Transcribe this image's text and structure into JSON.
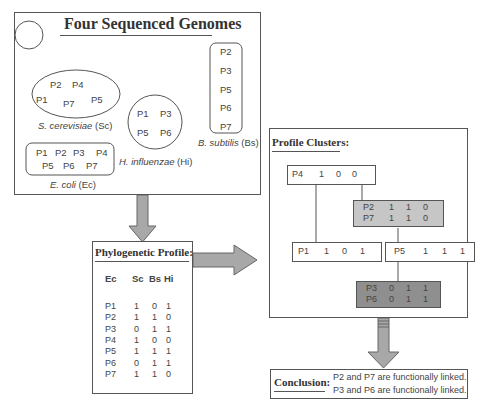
{
  "genomes_panel": {
    "title": "Four Sequenced Genomes",
    "organisms": [
      {
        "name_italic": "S. cerevisiae",
        "abbr": "(Sc)",
        "proteins": [
          "P2",
          "P4",
          "P1",
          "P7",
          "P5"
        ]
      },
      {
        "name_italic": "E. coli",
        "abbr": "(Ec)",
        "proteins": [
          "P1",
          "P2",
          "P3",
          "P4",
          "P5",
          "P6",
          "P7"
        ]
      },
      {
        "name_italic": "H. influenzae",
        "abbr": "(Hi)",
        "proteins": [
          "P1",
          "P3",
          "P5",
          "P6"
        ]
      },
      {
        "name_italic": "B. subtilis",
        "abbr": "(Bs)",
        "proteins": [
          "P2",
          "P3",
          "P5",
          "P6",
          "P7"
        ]
      }
    ]
  },
  "profile_panel": {
    "title": "Phylogenetic Profile:",
    "headers": [
      "Ec",
      "Sc",
      "Bs",
      "Hi"
    ],
    "rows": [
      {
        "protein": "P1",
        "sc": "1",
        "bs": "0",
        "hi": "1"
      },
      {
        "protein": "P2",
        "sc": "1",
        "bs": "1",
        "hi": "0"
      },
      {
        "protein": "P3",
        "sc": "0",
        "bs": "1",
        "hi": "1"
      },
      {
        "protein": "P4",
        "sc": "1",
        "bs": "0",
        "hi": "0"
      },
      {
        "protein": "P5",
        "sc": "1",
        "bs": "1",
        "hi": "1"
      },
      {
        "protein": "P6",
        "sc": "0",
        "bs": "1",
        "hi": "1"
      },
      {
        "protein": "P7",
        "sc": "1",
        "bs": "1",
        "hi": "0"
      }
    ]
  },
  "clusters_panel": {
    "title": "Profile Clusters:",
    "nodes": [
      {
        "id": "p4",
        "rows": [
          [
            "P4",
            "1",
            "0",
            "0"
          ]
        ],
        "shade": "none"
      },
      {
        "id": "p2p7",
        "rows": [
          [
            "P2",
            "1",
            "1",
            "0"
          ],
          [
            "P7",
            "1",
            "1",
            "0"
          ]
        ],
        "shade": "light"
      },
      {
        "id": "p1",
        "rows": [
          [
            "P1",
            "1",
            "0",
            "1"
          ]
        ],
        "shade": "none"
      },
      {
        "id": "p5",
        "rows": [
          [
            "P5",
            "1",
            "1",
            "1"
          ]
        ],
        "shade": "none"
      },
      {
        "id": "p3p6",
        "rows": [
          [
            "P3",
            "0",
            "1",
            "1"
          ],
          [
            "P6",
            "0",
            "1",
            "1"
          ]
        ],
        "shade": "dark"
      }
    ]
  },
  "conclusion": {
    "label": "Conclusion:",
    "lines": [
      "P2 and P7 are functionally linked.",
      "P3 and P6 are functionally linked."
    ]
  },
  "colors": {
    "arrow_fill": "#a8a8a8",
    "light_cluster": "#c6c6c6",
    "dark_cluster": "#8f8f8f",
    "border": "#555555"
  }
}
